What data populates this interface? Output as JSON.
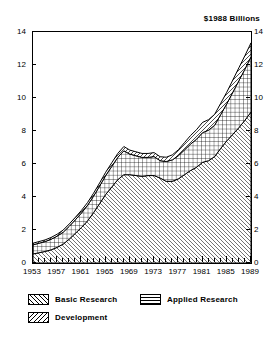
{
  "chart_data": {
    "type": "area",
    "title": "$1988 Billions",
    "xlabel": "",
    "ylabel": "",
    "stacked": true,
    "grid": false,
    "legend_position": "bottom-left",
    "xlim": [
      1953,
      1989
    ],
    "ylim": [
      0,
      14
    ],
    "ytick_labels": [
      "0",
      "2",
      "4",
      "6",
      "8",
      "10",
      "12",
      "14"
    ],
    "ytick_values": [
      0,
      2,
      4,
      6,
      8,
      10,
      12,
      14
    ],
    "xtick_labels": [
      "1953",
      "1957",
      "1961",
      "1965",
      "1969",
      "1973",
      "1977",
      "1981",
      "1985",
      "1989"
    ],
    "xtick_values": [
      1953,
      1957,
      1961,
      1965,
      1969,
      1973,
      1977,
      1981,
      1985,
      1989
    ],
    "dual_y_axis": true,
    "x": [
      1953,
      1954,
      1955,
      1956,
      1957,
      1958,
      1959,
      1960,
      1961,
      1962,
      1963,
      1964,
      1965,
      1966,
      1967,
      1968,
      1969,
      1970,
      1971,
      1972,
      1973,
      1974,
      1975,
      1976,
      1977,
      1978,
      1979,
      1980,
      1981,
      1982,
      1983,
      1984,
      1985,
      1986,
      1987,
      1988,
      1989
    ],
    "series": [
      {
        "name": "Development",
        "hatch": "backslash",
        "values": [
          0.55,
          0.62,
          0.7,
          0.8,
          0.95,
          1.15,
          1.45,
          1.8,
          2.15,
          2.55,
          3.05,
          3.6,
          4.15,
          4.6,
          5.05,
          5.35,
          5.35,
          5.3,
          5.25,
          5.3,
          5.3,
          5.15,
          4.95,
          4.95,
          5.1,
          5.35,
          5.6,
          5.8,
          6.1,
          6.2,
          6.45,
          6.95,
          7.4,
          7.8,
          8.2,
          8.65,
          9.15
        ]
      },
      {
        "name": "Applied Research",
        "hatch": "cross",
        "values": [
          0.55,
          0.58,
          0.6,
          0.64,
          0.68,
          0.72,
          0.78,
          0.82,
          0.88,
          0.94,
          1.0,
          1.06,
          1.15,
          1.25,
          1.35,
          1.45,
          1.25,
          1.2,
          1.15,
          1.1,
          1.15,
          1.05,
          1.2,
          1.3,
          1.4,
          1.5,
          1.6,
          1.7,
          1.8,
          1.85,
          1.9,
          2.05,
          2.25,
          2.55,
          2.85,
          3.1,
          3.35
        ]
      },
      {
        "name": "Basic Research",
        "hatch": "slash",
        "values": [
          0.1,
          0.1,
          0.1,
          0.11,
          0.12,
          0.13,
          0.14,
          0.15,
          0.16,
          0.17,
          0.18,
          0.19,
          0.2,
          0.22,
          0.24,
          0.26,
          0.24,
          0.24,
          0.24,
          0.24,
          0.24,
          0.24,
          0.26,
          0.3,
          0.36,
          0.44,
          0.52,
          0.58,
          0.62,
          0.64,
          0.66,
          0.68,
          0.7,
          0.74,
          0.78,
          0.82,
          0.84
        ]
      }
    ],
    "totals": [
      1.2,
      1.3,
      1.4,
      1.55,
      1.75,
      2.0,
      2.37,
      2.77,
      3.19,
      3.66,
      4.23,
      4.85,
      5.5,
      6.07,
      6.64,
      7.06,
      6.84,
      6.74,
      6.64,
      6.64,
      6.69,
      6.44,
      6.41,
      6.55,
      6.86,
      7.29,
      7.72,
      8.08,
      8.52,
      8.69,
      9.01,
      9.68,
      10.35,
      11.09,
      11.83,
      12.57,
      13.34
    ]
  },
  "legend": {
    "items": [
      {
        "label": "Basic Research",
        "swatch": "slash-swatch"
      },
      {
        "label": "Applied Research",
        "swatch": "cross-swatch"
      },
      {
        "label": "Development",
        "swatch": "backslash-swatch"
      }
    ]
  }
}
